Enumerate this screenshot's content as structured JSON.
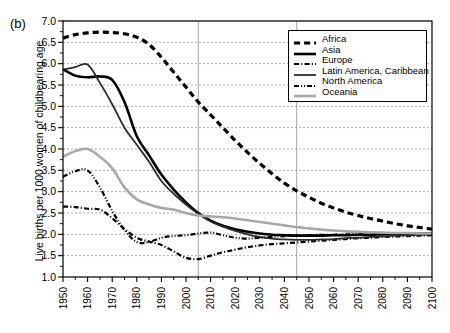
{
  "panel": {
    "label": "(b)"
  },
  "legend": {
    "position": "top-right",
    "entries": [
      {
        "label": "Africa",
        "dash": "dashed",
        "color": "#000000"
      },
      {
        "label": "Asia",
        "dash": "solid-thick",
        "color": "#000000"
      },
      {
        "label": "Europe",
        "dash": "dash-dot",
        "color": "#000000"
      },
      {
        "label": "Latin America, Caribbean",
        "dash": "solid-thin",
        "color": "#2b2b2b"
      },
      {
        "label": "North America",
        "dash": "dash-dot-dot",
        "color": "#000000"
      },
      {
        "label": "Oceania",
        "dash": "solid-gray",
        "color": "#a8a8a8"
      }
    ]
  },
  "chart_data": {
    "type": "line",
    "title": "",
    "xlabel": "",
    "ylabel": "Live births per 1000 women of childbearing age",
    "xlim": [
      1950,
      2100
    ],
    "ylim": [
      1.0,
      7.0
    ],
    "yticks": [
      "1.0",
      "1.5",
      "2.0",
      "2.5",
      "3.0",
      "3.5",
      "4.0",
      "4.5",
      "5.0",
      "5.5",
      "6.0",
      "6.5",
      "7.0"
    ],
    "xticks": [
      "1950",
      "1960",
      "1970",
      "1980",
      "1990",
      "2000",
      "2010",
      "2020",
      "2030",
      "2040",
      "2050",
      "2060",
      "2070",
      "2080",
      "2090",
      "2100"
    ],
    "xtick_minor_step": 5,
    "grid": "horizontal-dashed",
    "reference_lines": [
      2005,
      2045
    ],
    "x": [
      1950,
      1955,
      1960,
      1965,
      1970,
      1975,
      1980,
      1985,
      1990,
      1995,
      2000,
      2005,
      2010,
      2015,
      2020,
      2025,
      2030,
      2035,
      2040,
      2045,
      2050,
      2055,
      2060,
      2065,
      2070,
      2075,
      2080,
      2085,
      2090,
      2095,
      2100
    ],
    "series": [
      {
        "name": "Africa",
        "dash": "dashed",
        "color": "#000000",
        "width": 3.2,
        "values": [
          6.6,
          6.68,
          6.72,
          6.74,
          6.73,
          6.7,
          6.62,
          6.45,
          6.15,
          5.8,
          5.45,
          5.1,
          4.8,
          4.5,
          4.2,
          3.92,
          3.66,
          3.42,
          3.2,
          3.02,
          2.87,
          2.73,
          2.62,
          2.52,
          2.44,
          2.37,
          2.31,
          2.25,
          2.2,
          2.16,
          2.12
        ]
      },
      {
        "name": "Asia",
        "dash": "solid-thick",
        "color": "#000000",
        "width": 2.6,
        "values": [
          5.87,
          5.72,
          5.68,
          5.7,
          5.62,
          5.1,
          4.3,
          3.85,
          3.4,
          3.05,
          2.75,
          2.5,
          2.32,
          2.2,
          2.12,
          2.06,
          2.02,
          1.99,
          1.98,
          1.97,
          1.97,
          1.97,
          1.98,
          1.98,
          1.99,
          1.99,
          2.0,
          2.0,
          2.0,
          2.01,
          2.01
        ]
      },
      {
        "name": "Europe",
        "dash": "dash-dot",
        "color": "#000000",
        "width": 2.2,
        "values": [
          2.65,
          2.64,
          2.6,
          2.58,
          2.38,
          2.12,
          1.92,
          1.83,
          1.75,
          1.6,
          1.45,
          1.42,
          1.5,
          1.58,
          1.64,
          1.7,
          1.74,
          1.77,
          1.79,
          1.81,
          1.83,
          1.85,
          1.87,
          1.89,
          1.91,
          1.92,
          1.94,
          1.95,
          1.96,
          1.97,
          1.98
        ]
      },
      {
        "name": "Latin America, Caribbean",
        "dash": "solid-thin",
        "color": "#2b2b2b",
        "width": 1.8,
        "values": [
          5.86,
          5.92,
          5.98,
          5.55,
          5.05,
          4.5,
          4.1,
          3.7,
          3.25,
          2.95,
          2.7,
          2.48,
          2.3,
          2.18,
          2.08,
          2.0,
          1.94,
          1.9,
          1.88,
          1.87,
          1.87,
          1.88,
          1.89,
          1.91,
          1.92,
          1.94,
          1.95,
          1.97,
          1.98,
          1.99,
          2.0
        ]
      },
      {
        "name": "North America",
        "dash": "dash-dot-dot",
        "color": "#000000",
        "width": 2.2,
        "values": [
          3.35,
          3.48,
          3.5,
          3.1,
          2.55,
          2.1,
          1.82,
          1.82,
          1.92,
          1.96,
          1.98,
          2.02,
          2.04,
          1.98,
          1.92,
          1.9,
          1.92,
          1.94,
          1.96,
          1.97,
          1.98,
          1.99,
          1.99,
          2.0,
          2.0,
          2.0,
          2.01,
          2.01,
          2.01,
          2.02,
          2.02
        ]
      },
      {
        "name": "Oceania",
        "dash": "solid-gray",
        "color": "#a8a8a8",
        "width": 2.6,
        "values": [
          3.82,
          3.95,
          4.0,
          3.82,
          3.55,
          3.1,
          2.82,
          2.7,
          2.62,
          2.58,
          2.5,
          2.44,
          2.42,
          2.4,
          2.37,
          2.33,
          2.29,
          2.25,
          2.21,
          2.17,
          2.14,
          2.11,
          2.09,
          2.07,
          2.06,
          2.05,
          2.04,
          2.03,
          2.03,
          2.02,
          2.02
        ]
      }
    ]
  }
}
